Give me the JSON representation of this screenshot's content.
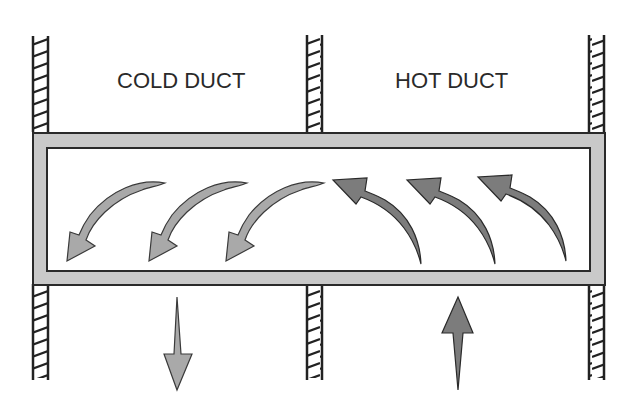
{
  "diagram": {
    "type": "airflow-schematic",
    "labels": {
      "cold_duct": "COLD DUCT",
      "hot_duct": "HOT DUCT"
    },
    "colors": {
      "frame_fill": "#c8c8c8",
      "frame_stroke": "#2a2a2a",
      "cold_arrow_fill": "#a9a9a9",
      "hot_arrow_fill": "#7c7c7c",
      "wall_stroke": "#222222"
    },
    "walls": [
      {
        "name": "left-wall",
        "x": 33
      },
      {
        "name": "center-wall",
        "x": 307
      },
      {
        "name": "right-wall",
        "x": 589
      }
    ],
    "flows": {
      "cold_side_curved_arrows": 3,
      "hot_side_curved_arrows": 3,
      "cold_outlet_direction": "down",
      "hot_inlet_direction": "up"
    }
  }
}
